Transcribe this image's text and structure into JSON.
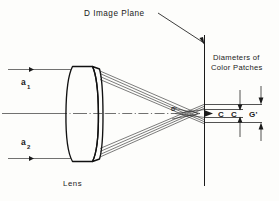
{
  "figure": {
    "title": "D Image Plane",
    "lens_label": "Lens",
    "side_label_line1": "Diameters  of",
    "side_label_line2": "Color  Patches",
    "focus_marker": "G'"
  },
  "rays": {
    "upper_label": "a",
    "upper_sub": "1",
    "lower_label": "a",
    "lower_sub": "2"
  },
  "patches": {
    "inner_left": "C",
    "inner_right": "C",
    "outer": "G'"
  },
  "colors": {
    "background": "#fdfdfb",
    "ink": "#1a1a1a",
    "ray": "#2a2a2a",
    "lens_outline": "#111111"
  }
}
